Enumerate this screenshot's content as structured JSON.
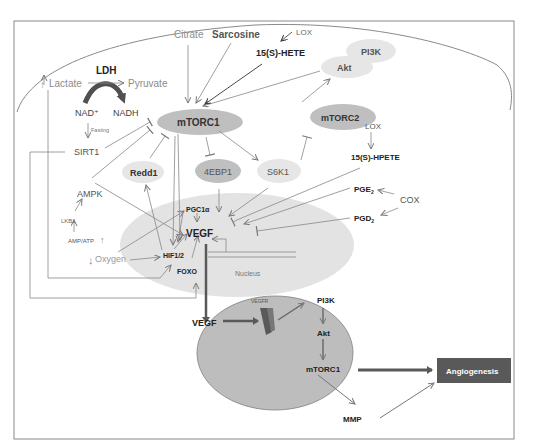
{
  "header_fragment": "…",
  "cell": {
    "nodes": {
      "citrate": "Citrate",
      "sarcosine": "Sarcosine",
      "lox_top": "LOX",
      "hete": "15(S)-HETE",
      "pi3k_top": "PI3K",
      "akt_top": "Akt",
      "lactate": "Lactate",
      "lactate_up": "↑",
      "ldh": "LDH",
      "pyruvate": "Pyruvate",
      "nad": "NAD⁺",
      "nadh": "NADH",
      "fasting": "Fasting",
      "sirt1": "SIRT1",
      "mtorc1": "mTORC1",
      "mtorc2": "mTORC2",
      "lox_mid": "LOX",
      "hpete": "15(S)-HPETE",
      "redd1": "Redd1",
      "ebp1": "4EBP1",
      "s6k1": "S6K1",
      "ampk": "AMPK",
      "lkb1": "LKB1",
      "ampatp": "AMP/ATP",
      "ampatp_up": "↑",
      "oxygen_down": "↓",
      "oxygen": "Oxygen",
      "pgc1a": "PGC1α",
      "vegf_nuc": "VEGF",
      "hif": "HIF1/2",
      "foxo": "FOXO",
      "nucleus": "Nucleus",
      "pge2": "PGE",
      "pge2_sub": "2",
      "pgd2": "PGD",
      "pgd2_sub": "2",
      "cox": "COX"
    }
  },
  "endothelial": {
    "vegf_out": "VEGF",
    "vegfr": "VEGFR",
    "pi3k": "PI3K",
    "akt": "Akt",
    "mtorc1": "mTORC1",
    "mmp": "MMP",
    "angiogenesis": "Angiogenesis"
  },
  "colors": {
    "frame": "#808080",
    "gray_text": "#8c8c8c",
    "node_light": "#e6e6e6",
    "node_mid": "#bfbfbf",
    "nucleus": "#e3e3e3",
    "endo_cell": "#bdbdbd",
    "angio_box": "#595959",
    "thick_arrow": "#595959",
    "ldh_arrow": "#505050"
  }
}
